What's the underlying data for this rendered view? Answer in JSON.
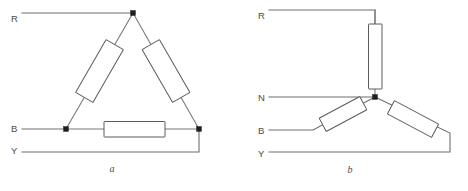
{
  "figure": {
    "width": 468,
    "height": 191,
    "background": "#ffffff",
    "wire_color": "#6e6e6e",
    "resistor_stroke": "#5a5a5a",
    "resistor_fill": "#ffffff",
    "node_color": "#1d1d1d",
    "text_color": "#4a4a4a"
  },
  "diagram_a": {
    "caption": "a",
    "type": "delta-connection",
    "terminals": [
      {
        "label": "R",
        "x": 11,
        "y": 22
      },
      {
        "label": "B",
        "x": 11,
        "y": 132
      },
      {
        "label": "Y",
        "x": 11,
        "y": 154
      }
    ],
    "resistors": [
      {
        "name": "resistor-left-arm"
      },
      {
        "name": "resistor-right-arm"
      },
      {
        "name": "resistor-bottom-arm"
      }
    ],
    "nodes": [
      {
        "name": "node-apex"
      },
      {
        "name": "node-bottom-left"
      },
      {
        "name": "node-bottom-right"
      }
    ]
  },
  "diagram_b": {
    "caption": "b",
    "type": "star-connection",
    "terminals": [
      {
        "label": "R",
        "x": 258,
        "y": 19
      },
      {
        "label": "N",
        "x": 258,
        "y": 97
      },
      {
        "label": "B",
        "x": 258,
        "y": 136
      },
      {
        "label": "Y",
        "x": 258,
        "y": 159
      }
    ],
    "resistors": [
      {
        "name": "resistor-vertical"
      },
      {
        "name": "resistor-lower-left"
      },
      {
        "name": "resistor-lower-right"
      }
    ],
    "nodes": [
      {
        "name": "node-star-point"
      }
    ]
  }
}
